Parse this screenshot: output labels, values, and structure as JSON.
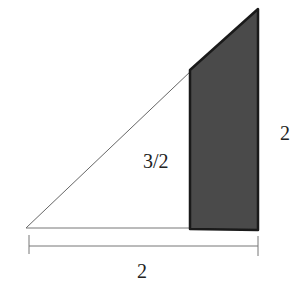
{
  "diagram": {
    "labels": {
      "inner_height": "3/2",
      "right_height": "2",
      "base_width": "2"
    },
    "colors": {
      "shade_fill": "#4a4a4a",
      "shade_stroke": "#1a1a1a",
      "line": "#555555",
      "background": "#ffffff"
    }
  }
}
